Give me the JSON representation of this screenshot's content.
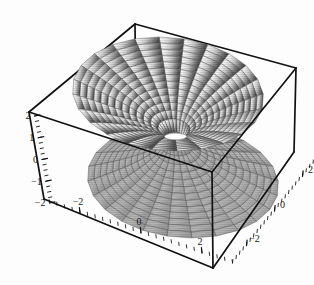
{
  "figure": {
    "title": "",
    "background_color": "#fdfdfd",
    "frame_color": "#111111",
    "mesh_color": "#555555"
  },
  "chart_data": {
    "type": "surface3d",
    "title": "",
    "subtitle": "",
    "xlabel": "",
    "ylabel": "",
    "zlabel": "",
    "xlim": [
      -3,
      3
    ],
    "ylim": [
      -3,
      3
    ],
    "zlim": [
      -2,
      2
    ],
    "grid": false,
    "legend": "none",
    "axes": [
      {
        "name": "z-axis",
        "orientation": "vertical-left",
        "ticks": [
          2,
          1,
          0,
          -1,
          -2
        ],
        "tick_labels": [
          "2",
          "1",
          "0",
          "−1",
          "−2"
        ],
        "minor_ticks_per_interval": 4
      },
      {
        "name": "x-axis",
        "orientation": "bottom-left-front",
        "ticks": [
          -2,
          0,
          2
        ],
        "tick_labels": [
          "−2",
          "0",
          "2"
        ],
        "minor_ticks_per_interval": 4
      },
      {
        "name": "y-axis",
        "orientation": "bottom-right-front",
        "ticks": [
          -2,
          0,
          2
        ],
        "tick_labels": [
          "−2",
          "0",
          "2"
        ],
        "minor_ticks_per_interval": 4
      }
    ],
    "surface": {
      "parameterization": "polar",
      "radial_samples": 14,
      "angular_samples": 24,
      "r_range": [
        0.28,
        2.85
      ],
      "sheets": [
        {
          "name": "upper-sheet",
          "z_sign": 1,
          "shading": "gradient-light-left-to-dark-right",
          "light_color": "#f2f2f2",
          "dark_color": "#4a4a4a"
        },
        {
          "name": "lower-sheet",
          "z_sign": -1,
          "shading": "uniform-mid-gray",
          "light_color": "#b8b8b8",
          "dark_color": "#8c8c8c"
        }
      ]
    },
    "projection": {
      "type": "axonometric",
      "box_corners_px": {
        "top_back": [
          135,
          24
        ],
        "top_left": [
          29,
          112
        ],
        "top_right": [
          296,
          68
        ],
        "top_front": [
          212,
          172
        ],
        "bottom_left": [
          44,
          199
        ],
        "bottom_right": [
          294,
          152
        ],
        "bottom_front": [
          213,
          268
        ]
      }
    }
  },
  "axis_labels": {
    "z": [
      "2",
      "1",
      "0",
      "−1",
      "−2"
    ],
    "x": [
      "−2",
      "0",
      "2"
    ],
    "y": [
      "2",
      "0",
      "−2"
    ]
  }
}
